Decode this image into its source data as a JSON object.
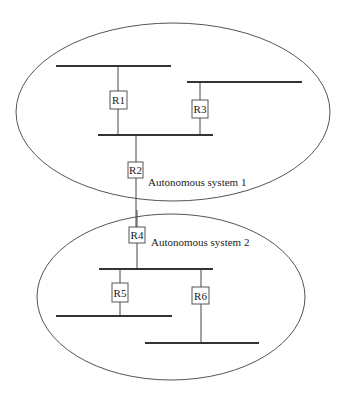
{
  "diagram": {
    "colors": {
      "background": "#ffffff",
      "line": "#333333",
      "ellipse": "#555555",
      "text": "#222222"
    },
    "autonomous_systems": [
      {
        "id": "as1",
        "label": "Autonomous system 1",
        "cx": 173,
        "cy": 112,
        "rx": 157,
        "ry": 89,
        "label_x": 148,
        "label_y": 186
      },
      {
        "id": "as2",
        "label": "Autonomous system 2",
        "cx": 171,
        "cy": 297,
        "rx": 134,
        "ry": 83,
        "label_x": 151,
        "label_y": 246
      }
    ],
    "networks": [
      {
        "id": "net-a",
        "x1": 56,
        "y1": 66,
        "x2": 171,
        "y2": 66
      },
      {
        "id": "net-b",
        "x1": 187,
        "y1": 82,
        "x2": 302,
        "y2": 82
      },
      {
        "id": "net-c",
        "x1": 98,
        "y1": 135,
        "x2": 213,
        "y2": 135
      },
      {
        "id": "net-d",
        "x1": 99,
        "y1": 269,
        "x2": 213,
        "y2": 269
      },
      {
        "id": "net-e",
        "x1": 56,
        "y1": 316,
        "x2": 172,
        "y2": 316
      },
      {
        "id": "net-f",
        "x1": 145,
        "y1": 343,
        "x2": 259,
        "y2": 343
      }
    ],
    "routers": [
      {
        "id": "R1",
        "label": "R1",
        "x": 110,
        "y": 91,
        "w": 17,
        "h": 18,
        "line_x": 118,
        "line_y1": 66,
        "line_y2": 135
      },
      {
        "id": "R3",
        "label": "R3",
        "x": 192,
        "y": 100,
        "w": 16,
        "h": 18,
        "line_x": 200,
        "line_y1": 82,
        "line_y2": 135
      },
      {
        "id": "R2",
        "label": "R2",
        "x": 128,
        "y": 162,
        "w": 15,
        "h": 16,
        "line_x": 136,
        "line_y1": 135,
        "line_y2": 227
      },
      {
        "id": "R4",
        "label": "R4",
        "x": 129,
        "y": 227,
        "w": 16,
        "h": 16,
        "line_x": 137,
        "line_y1": 210,
        "line_y2": 269
      },
      {
        "id": "R5",
        "label": "R5",
        "x": 112,
        "y": 283,
        "w": 16,
        "h": 19,
        "line_x": 120,
        "line_y1": 269,
        "line_y2": 316
      },
      {
        "id": "R6",
        "label": "R6",
        "x": 192,
        "y": 287,
        "w": 17,
        "h": 17,
        "line_x": 201,
        "line_y1": 269,
        "line_y2": 343
      }
    ]
  }
}
